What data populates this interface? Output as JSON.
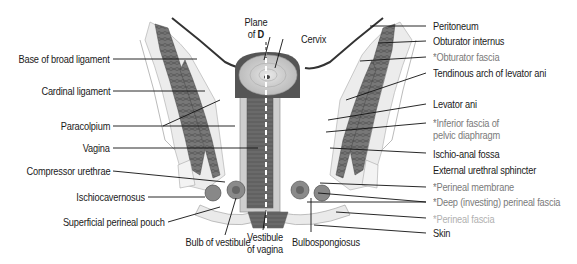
{
  "figure": {
    "colors": {
      "label_text": "#1a1a1a",
      "fascia_text": "#7a7a7a",
      "perineal_fascia_text": "#b0b0b0",
      "leader_line": "#111111",
      "muscle": "#6e6e6e",
      "tissue_light": "#e4e4e4",
      "background": "#ffffff"
    },
    "top_labels": {
      "plane_line1": "Plane",
      "plane_line2_prefix": "of ",
      "plane_line2_bold": "D",
      "cervix": "Cervix"
    },
    "left_labels": [
      "Base of broad ligament",
      "Cardinal ligament",
      "Paracolpium",
      "Vagina",
      "Compressor urethrae",
      "Ischiocavernosus",
      "Superficial perineal pouch"
    ],
    "bottom_labels": {
      "bulb": "Bulb of vestibule",
      "vestibule_line1": "Vestibule",
      "vestibule_line2": "of vagina",
      "bulbospongiosus": "Bulbospongiosus"
    },
    "right_labels": {
      "peritoneum": "Peritoneum",
      "obturator_internus": "Obturator internus",
      "obturator_fascia": "*Obturator fascia",
      "tendinous_arch": "Tendinous arch of levator ani",
      "levator_ani": "Levator ani",
      "inferior_fascia_line1": "*Inferior fascia of",
      "inferior_fascia_line2": "pelvic diaphragm",
      "ischio_anal_fossa": "Ischio-anal fossa",
      "external_urethral_sphincter": "External urethral sphincter",
      "perineal_membrane": "*Perineal membrane",
      "deep_perineal_fascia": "*Deep (investing) perineal fascia",
      "perineal_fascia": "*Perineal fascia",
      "skin": "Skin"
    }
  }
}
